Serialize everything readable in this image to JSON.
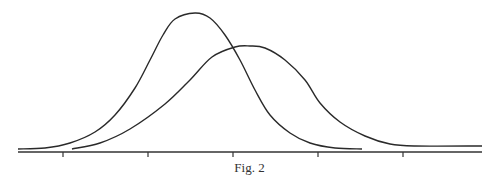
{
  "caption": "Fig. 2",
  "colors": {
    "line": "#2a2a2a",
    "axis": "#333333",
    "background": "#ffffff"
  },
  "chart_data": {
    "type": "line",
    "title": "",
    "caption": "Fig. 2",
    "xlabel": "",
    "ylabel": "",
    "grid": false,
    "legend": null,
    "axis": {
      "x_ticks_px": [
        63,
        148,
        233,
        318,
        403
      ],
      "tick_labels": [
        "",
        "",
        "",
        "",
        ""
      ]
    },
    "series": [
      {
        "name": "curve-a (narrow, taller)",
        "points_px": [
          [
            18,
            149
          ],
          [
            45,
            148
          ],
          [
            70,
            143
          ],
          [
            95,
            132
          ],
          [
            115,
            115
          ],
          [
            135,
            88
          ],
          [
            150,
            60
          ],
          [
            163,
            35
          ],
          [
            175,
            19
          ],
          [
            195,
            13
          ],
          [
            210,
            18
          ],
          [
            225,
            35
          ],
          [
            240,
            60
          ],
          [
            255,
            90
          ],
          [
            270,
            115
          ],
          [
            290,
            133
          ],
          [
            310,
            143
          ],
          [
            335,
            148
          ],
          [
            362,
            149
          ]
        ]
      },
      {
        "name": "curve-b (wider, shorter, shifted right)",
        "points_px": [
          [
            72,
            149
          ],
          [
            100,
            143
          ],
          [
            130,
            129
          ],
          [
            165,
            104
          ],
          [
            190,
            80
          ],
          [
            212,
            57
          ],
          [
            235,
            47
          ],
          [
            250,
            46
          ],
          [
            265,
            48
          ],
          [
            285,
            60
          ],
          [
            305,
            80
          ],
          [
            320,
            103
          ],
          [
            340,
            122
          ],
          [
            365,
            136
          ],
          [
            390,
            144
          ],
          [
            415,
            146
          ],
          [
            482,
            146
          ]
        ]
      }
    ],
    "relative_peaks": {
      "curve-a": 1.0,
      "curve-b": 0.76
    },
    "note": "Two unlabeled bell-shaped distributions; curve B is broader and centered to the right of curve A."
  }
}
